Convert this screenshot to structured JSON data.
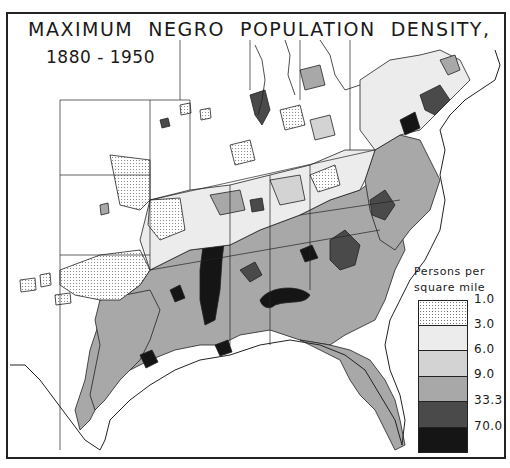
{
  "map": {
    "title": "MAXIMUM  NEGRO  POPULATION  DENSITY,",
    "subtitle": "1880 - 1950",
    "region": "Eastern and Southern United States",
    "legend": {
      "title_line1": "Persons per",
      "title_line2": "square mile",
      "classes": [
        {
          "label": "1.0",
          "fill": "#f4f4f4",
          "pattern": "dotted"
        },
        {
          "label": "3.0",
          "fill": "#ececec",
          "pattern": "solid"
        },
        {
          "label": "6.0",
          "fill": "#d3d3d3",
          "pattern": "solid"
        },
        {
          "label": "9.0",
          "fill": "#a8a8a8",
          "pattern": "solid"
        },
        {
          "label": "33.3",
          "fill": "#4a4a4a",
          "pattern": "solid"
        },
        {
          "label": "70.0",
          "fill": "#151515",
          "pattern": "solid"
        }
      ]
    },
    "colors": {
      "background": "#ffffff",
      "outline": "#222222",
      "class_1": "#f4f4f4",
      "class_2": "#ececec",
      "class_3": "#d3d3d3",
      "class_4": "#a8a8a8",
      "class_5": "#4a4a4a",
      "class_6": "#151515"
    }
  }
}
